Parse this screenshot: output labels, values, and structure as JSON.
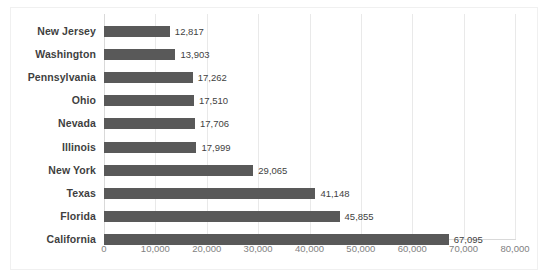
{
  "chart_data": {
    "type": "bar",
    "orientation": "horizontal",
    "title": "",
    "subtitle": "",
    "xlabel": "",
    "ylabel": "",
    "xlim": [
      0,
      80000
    ],
    "xticks": [
      0,
      10000,
      20000,
      30000,
      40000,
      50000,
      60000,
      70000,
      80000
    ],
    "xtick_labels": [
      "0",
      "10,000",
      "20,000",
      "30,000",
      "40,000",
      "50,000",
      "60,000",
      "70,000",
      "80,000"
    ],
    "grid": "vertical",
    "legend": "none",
    "bar_color": "#595959",
    "gridline_color": "#E9E9E9",
    "label_color": "#3F3F3F",
    "tick_color": "#7F7F7F",
    "data_labels_shown": true,
    "categories": [
      "New Jersey",
      "Washington",
      "Pennsylvania",
      "Ohio",
      "Nevada",
      "Illinois",
      "New York",
      "Texas",
      "Florida",
      "California"
    ],
    "values": [
      12817,
      13903,
      17262,
      17510,
      17706,
      17999,
      29065,
      41148,
      45855,
      67095
    ],
    "value_labels": [
      "12,817",
      "13,903",
      "17,262",
      "17,510",
      "17,706",
      "17,999",
      "29,065",
      "41,148",
      "45,855",
      "67,095"
    ]
  }
}
